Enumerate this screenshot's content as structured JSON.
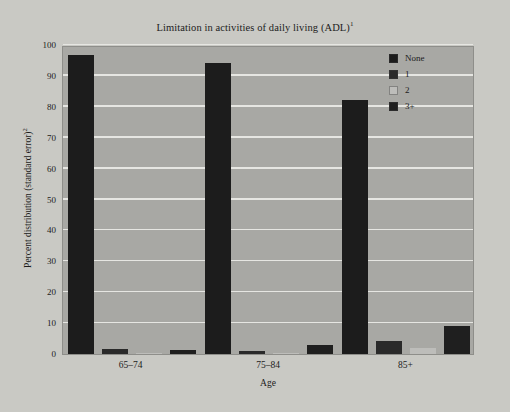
{
  "chart_data": {
    "type": "bar",
    "title": "Limitation in activities of daily living (ADL)",
    "title_superscript": "1",
    "xlabel": "Age",
    "ylabel": "Percent distribution (standard error)",
    "ylabel_superscript": "2",
    "categories": [
      "65–74",
      "75–84",
      "85+"
    ],
    "ylim": [
      0,
      100
    ],
    "yticks": [
      0,
      10,
      20,
      30,
      40,
      50,
      60,
      70,
      80,
      90,
      100
    ],
    "grid": true,
    "legend_position": "top-right",
    "series": [
      {
        "name": "None",
        "color": "#1c1c1c",
        "values": [
          96.8,
          94.2,
          82.3
        ]
      },
      {
        "name": "1",
        "color": "#2a2a2a",
        "values": [
          1.5,
          1.0,
          4.1
        ]
      },
      {
        "name": "2",
        "color": "#bdbdba",
        "values": [
          0.4,
          0.4,
          2.0
        ]
      },
      {
        "name": "3+",
        "color": "#1f1f1f",
        "values": [
          1.4,
          3.0,
          9.0
        ]
      }
    ]
  },
  "legend": {
    "items": [
      {
        "label": "None"
      },
      {
        "label": "1"
      },
      {
        "label": "2"
      },
      {
        "label": "3+"
      }
    ]
  },
  "colors": {
    "page_background": "#c9c9c4",
    "plot_background": "#a8a8a4",
    "gridline": "#e6e6e2",
    "text": "#1c1c1c"
  }
}
